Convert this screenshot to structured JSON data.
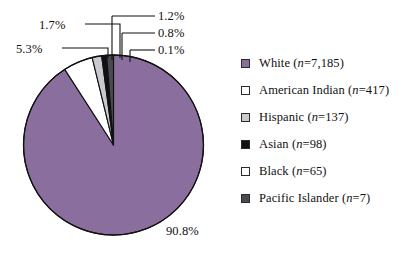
{
  "chart_data": {
    "type": "pie",
    "title": "",
    "subtitle": "",
    "xlabel": "",
    "ylabel": "",
    "grid": false,
    "legend_position": "right",
    "start_angle_deg": 90,
    "direction": "counterclockwise",
    "categories": [
      "White",
      "American Indian",
      "Hispanic",
      "Asian",
      "Black",
      "Pacific Islander"
    ],
    "values": [
      90.8,
      5.3,
      1.7,
      0.8,
      0.1,
      1.2
    ],
    "counts": [
      7185,
      417,
      137,
      98,
      65,
      7
    ],
    "value_unit": "%",
    "slices": [
      {
        "name": "White",
        "percent": 90.8,
        "percent_label": "90.8%",
        "count": 7185,
        "count_label": "n=7,185",
        "color": "#8a6f9e"
      },
      {
        "name": "American Indian",
        "percent": 5.3,
        "percent_label": "5.3%",
        "count": 417,
        "count_label": "n=417",
        "color": "#ffffff"
      },
      {
        "name": "Hispanic",
        "percent": 1.7,
        "percent_label": "1.7%",
        "count": 137,
        "count_label": "n=137",
        "color": "#c9c9ce"
      },
      {
        "name": "Asian",
        "percent": 0.8,
        "percent_label": "0.8%",
        "count": 98,
        "count_label": "n=98",
        "color": "#111111"
      },
      {
        "name": "Black",
        "percent": 0.1,
        "percent_label": "0.1%",
        "count": 65,
        "count_label": "n=65",
        "color": "#ffffff"
      },
      {
        "name": "Pacific Islander",
        "percent": 1.2,
        "percent_label": "1.2%",
        "count": 7,
        "count_label": "n=7",
        "color": "#4a4a52"
      }
    ],
    "annotations": [
      "90.8%",
      "5.3%",
      "1.7%",
      "1.2%",
      "0.8%",
      "0.1%"
    ]
  },
  "labels": {
    "white_pct": "90.8%",
    "american_indian_pct": "5.3%",
    "hispanic_pct": "1.7%",
    "pacific_islander_pct": "1.2%",
    "asian_pct": "0.8%",
    "black_pct": "0.1%"
  },
  "legend": {
    "items": [
      {
        "name": "White",
        "label": "White",
        "n_prefix": "(",
        "n_italic": "n",
        "n_rest": "=7,185)",
        "color": "#8a6f9e"
      },
      {
        "name": "American Indian",
        "label": "American Indian",
        "n_prefix": "(",
        "n_italic": "n",
        "n_rest": "=417)",
        "color": "#ffffff"
      },
      {
        "name": "Hispanic",
        "label": "Hispanic",
        "n_prefix": "(",
        "n_italic": "n",
        "n_rest": "=137)",
        "color": "#c9c9ce"
      },
      {
        "name": "Asian",
        "label": "Asian",
        "n_prefix": "(",
        "n_italic": "n",
        "n_rest": "=98)",
        "color": "#111111"
      },
      {
        "name": "Black",
        "label": "Black",
        "n_prefix": "(",
        "n_italic": "n",
        "n_rest": "=65)",
        "color": "#ffffff"
      },
      {
        "name": "Pacific Islander",
        "label": "Pacific Islander",
        "n_prefix": "(",
        "n_italic": "n",
        "n_rest": "=7)",
        "color": "#4a4a52"
      }
    ]
  },
  "style": {
    "background": "#ffffff",
    "outline": "#111111",
    "leader_line": "#111111",
    "text": "#111111"
  }
}
